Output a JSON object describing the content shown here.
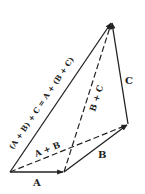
{
  "diagram": {
    "points": {
      "O": [
        10,
        172
      ],
      "P": [
        64,
        172
      ],
      "Q": [
        128,
        124
      ],
      "R": [
        112,
        22
      ]
    },
    "vectors": [
      {
        "id": "A",
        "from": "O",
        "to": "P",
        "style": "solid",
        "label": "A"
      },
      {
        "id": "B",
        "from": "P",
        "to": "Q",
        "style": "solid",
        "label": "B"
      },
      {
        "id": "C",
        "from": "Q",
        "to": "R",
        "style": "solid",
        "label": "C"
      },
      {
        "id": "AB",
        "from": "O",
        "to": "Q",
        "style": "dashed",
        "label": "A + B"
      },
      {
        "id": "BC",
        "from": "P",
        "to": "R",
        "style": "dashed",
        "label": "B + C"
      },
      {
        "id": "sum",
        "from": "O",
        "to": "R",
        "style": "solid",
        "label": "(A + B) + C = A + (B + C)"
      }
    ],
    "labels": {
      "A": "A",
      "B": "B",
      "C": "C",
      "AB": "A + B",
      "BC": "B + C",
      "sum": "(A + B) + C = A + (B + C)"
    },
    "color": "#222222"
  }
}
